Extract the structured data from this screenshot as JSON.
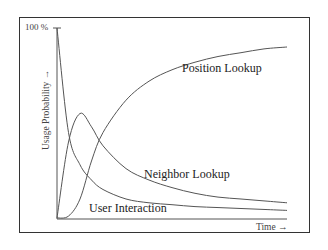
{
  "chart_data": {
    "type": "line",
    "title": "",
    "xlabel": "Time →",
    "ylabel": "Usage Probability →",
    "y_tick_top": "100 %",
    "ylim": [
      0,
      100
    ],
    "grid": false,
    "legend": "inline labels",
    "x": [
      0,
      0.05,
      0.1,
      0.15,
      0.2,
      0.3,
      0.4,
      0.5,
      0.6,
      0.7,
      0.8,
      0.9,
      1.0
    ],
    "series": [
      {
        "name": "Position Lookup",
        "values": [
          0,
          1,
          10,
          30,
          45,
          62,
          72,
          78,
          82,
          85,
          87,
          89,
          90
        ]
      },
      {
        "name": "Neighbor Lookup",
        "values": [
          0,
          40,
          55,
          48,
          38,
          26,
          20,
          16,
          13,
          11,
          10,
          9,
          8
        ]
      },
      {
        "name": "User Interaction",
        "values": [
          100,
          45,
          28,
          20,
          15,
          10,
          8,
          7,
          6,
          5.5,
          5,
          4.5,
          4
        ]
      }
    ]
  },
  "labels": {
    "position": "Position Lookup",
    "neighbor": "Neighbor Lookup",
    "user": "User Interaction",
    "time": "Time →",
    "usage": "Usage Probability →",
    "tick100": "100 %"
  }
}
